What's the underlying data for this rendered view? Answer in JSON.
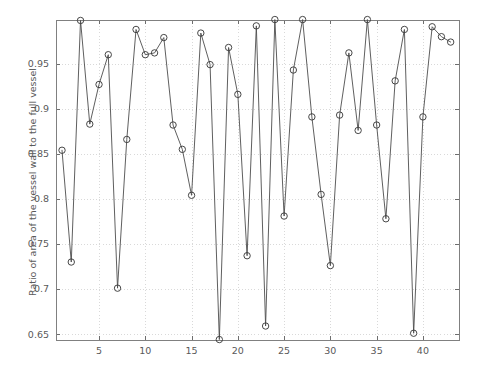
{
  "chart_data": {
    "type": "line",
    "title": "",
    "subtitle": "",
    "xlabel": "",
    "ylabel": "Ratio of area of the vessel wall to the full vessel",
    "xlim": [
      0.35,
      43.9
    ],
    "ylim": [
      0.6435,
      0.9985
    ],
    "xticks": [
      5,
      10,
      15,
      20,
      25,
      30,
      35,
      40
    ],
    "xticklabels": [
      "5",
      "10",
      "15",
      "20",
      "25",
      "30",
      "35",
      "40"
    ],
    "yticks": [
      0.65,
      0.7,
      0.75,
      0.8,
      0.85,
      0.9,
      0.95
    ],
    "yticklabels": [
      "0.65",
      "0.7",
      "0.75",
      "0.8",
      "0.85",
      "0.9",
      "0.95"
    ],
    "grid": true,
    "grid_style": "dotted",
    "legend": null,
    "marker": "circle-open",
    "line_color": "#4d4d4d",
    "marker_color": "#3d3d3d",
    "grid_color": "#cfcfcf",
    "frame_color": "#808080",
    "text_color": "#595959",
    "background": "#ffffff",
    "x": [
      1,
      2,
      3,
      4,
      5,
      6,
      7,
      8,
      9,
      10,
      11,
      12,
      13,
      14,
      15,
      16,
      17,
      18,
      19,
      20,
      21,
      22,
      23,
      24,
      25,
      26,
      27,
      28,
      29,
      30,
      31,
      32,
      33,
      34,
      35,
      36,
      37,
      38,
      39,
      40,
      41,
      42,
      43
    ],
    "values": [
      0.854,
      0.73,
      0.998,
      0.883,
      0.927,
      0.96,
      0.701,
      0.866,
      0.988,
      0.96,
      0.962,
      0.979,
      0.882,
      0.855,
      0.804,
      0.984,
      0.949,
      0.644,
      0.968,
      0.916,
      0.737,
      0.992,
      0.659,
      0.999,
      0.781,
      0.943,
      0.999,
      0.891,
      0.805,
      0.726,
      0.893,
      0.962,
      0.876,
      0.999,
      0.882,
      0.778,
      0.931,
      0.988,
      0.651,
      0.891,
      0.991,
      0.98,
      0.974
    ],
    "series": [
      {
        "name": "Ratio of area of the vessel wall to the full vessel",
        "values": [
          0.854,
          0.73,
          0.998,
          0.883,
          0.927,
          0.96,
          0.701,
          0.866,
          0.988,
          0.96,
          0.962,
          0.979,
          0.882,
          0.855,
          0.804,
          0.984,
          0.949,
          0.644,
          0.968,
          0.916,
          0.737,
          0.992,
          0.659,
          0.999,
          0.781,
          0.943,
          0.999,
          0.891,
          0.805,
          0.726,
          0.893,
          0.962,
          0.876,
          0.999,
          0.882,
          0.778,
          0.931,
          0.988,
          0.651,
          0.891,
          0.991,
          0.98,
          0.974
        ]
      }
    ],
    "n_points": 43
  }
}
